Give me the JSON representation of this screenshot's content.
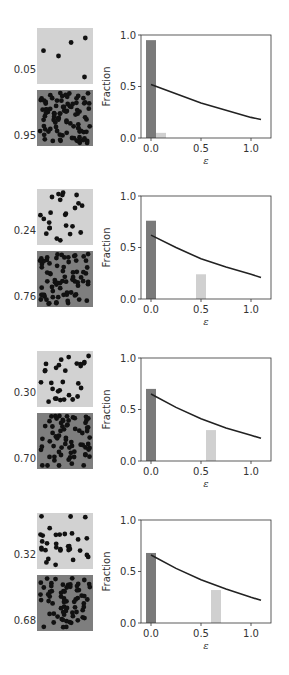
{
  "chart_data": [
    {
      "type": "bar+line",
      "xlabel": "ε",
      "ylabel": "Fraction",
      "xlim": [
        -0.1,
        1.2
      ],
      "ylim": [
        0.0,
        1.0
      ],
      "xticks": [
        "0.0",
        "0.5",
        "1.0"
      ],
      "yticks": [
        "0.0",
        "0.5",
        "1.0"
      ],
      "thumbnails": [
        {
          "label": "0.05",
          "shade": "light"
        },
        {
          "label": "0.95",
          "shade": "dark"
        }
      ],
      "bars": [
        {
          "x": 0.0,
          "height": 0.95,
          "color": "#7a7a7a"
        },
        {
          "x": 0.1,
          "height": 0.05,
          "color": "#d0d0d0"
        }
      ],
      "curve": {
        "x": [
          0.0,
          0.25,
          0.5,
          0.75,
          1.0,
          1.1
        ],
        "y": [
          0.52,
          0.43,
          0.34,
          0.27,
          0.2,
          0.18
        ]
      }
    },
    {
      "type": "bar+line",
      "xlabel": "ε",
      "ylabel": "Fraction",
      "xlim": [
        -0.1,
        1.2
      ],
      "ylim": [
        0.0,
        1.0
      ],
      "xticks": [
        "0.0",
        "0.5",
        "1.0"
      ],
      "yticks": [
        "0.0",
        "0.5",
        "1.0"
      ],
      "thumbnails": [
        {
          "label": "0.24",
          "shade": "light"
        },
        {
          "label": "0.76",
          "shade": "dark"
        }
      ],
      "bars": [
        {
          "x": 0.0,
          "height": 0.76,
          "color": "#7a7a7a"
        },
        {
          "x": 0.5,
          "height": 0.24,
          "color": "#d0d0d0"
        }
      ],
      "curve": {
        "x": [
          0.0,
          0.25,
          0.5,
          0.75,
          1.0,
          1.1
        ],
        "y": [
          0.62,
          0.5,
          0.39,
          0.31,
          0.24,
          0.21
        ]
      }
    },
    {
      "type": "bar+line",
      "xlabel": "ε",
      "ylabel": "Fraction",
      "xlim": [
        -0.1,
        1.2
      ],
      "ylim": [
        0.0,
        1.0
      ],
      "xticks": [
        "0.0",
        "0.5",
        "1.0"
      ],
      "yticks": [
        "0.0",
        "0.5",
        "1.0"
      ],
      "thumbnails": [
        {
          "label": "0.30",
          "shade": "light"
        },
        {
          "label": "0.70",
          "shade": "dark"
        }
      ],
      "bars": [
        {
          "x": 0.0,
          "height": 0.7,
          "color": "#7a7a7a"
        },
        {
          "x": 0.6,
          "height": 0.3,
          "color": "#d0d0d0"
        }
      ],
      "curve": {
        "x": [
          0.0,
          0.25,
          0.5,
          0.75,
          1.0,
          1.1
        ],
        "y": [
          0.65,
          0.52,
          0.41,
          0.32,
          0.25,
          0.22
        ]
      }
    },
    {
      "type": "bar+line",
      "xlabel": "ε",
      "ylabel": "Fraction",
      "xlim": [
        -0.1,
        1.2
      ],
      "ylim": [
        0.0,
        1.0
      ],
      "xticks": [
        "0.0",
        "0.5",
        "1.0"
      ],
      "yticks": [
        "0.0",
        "0.5",
        "1.0"
      ],
      "thumbnails": [
        {
          "label": "0.32",
          "shade": "light"
        },
        {
          "label": "0.68",
          "shade": "dark"
        }
      ],
      "bars": [
        {
          "x": 0.0,
          "height": 0.68,
          "color": "#7a7a7a"
        },
        {
          "x": 0.65,
          "height": 0.32,
          "color": "#d0d0d0"
        }
      ],
      "curve": {
        "x": [
          0.0,
          0.25,
          0.5,
          0.75,
          1.0,
          1.1
        ],
        "y": [
          0.66,
          0.53,
          0.42,
          0.33,
          0.25,
          0.22
        ]
      }
    }
  ],
  "colors": {
    "light_thumb_bg": "#d2d2d2",
    "dark_thumb_bg": "#7e7e7e",
    "dot": "#111111",
    "axis": "#333333",
    "curve": "#222222"
  }
}
